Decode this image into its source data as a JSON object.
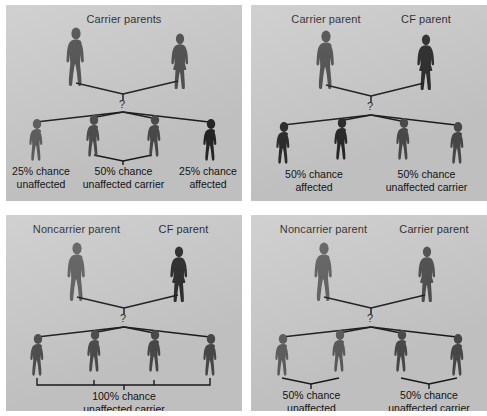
{
  "figure": {
    "caption_title": "Cystic fibrosis inheritance patterns",
    "colors": {
      "panel_background": "#c9c9c9",
      "page_background": "#ffffff",
      "figure_unaffected": "#5a5a5a",
      "figure_carrier": "#4a4a4a",
      "figure_affected": "#262626",
      "line": "#1a1a1a",
      "text": "#131313"
    },
    "unknown_marker": "?"
  },
  "panels": [
    {
      "id": "panel-carrier-x-carrier",
      "position": "top-left",
      "parents": [
        {
          "label": "Carrier parents",
          "sex": "male",
          "status": "carrier"
        },
        {
          "label": "",
          "sex": "female",
          "status": "carrier"
        }
      ],
      "parent_title": "Carrier parents",
      "parent_title_span": "both",
      "children": [
        {
          "status": "unaffected"
        },
        {
          "status": "carrier"
        },
        {
          "status": "carrier"
        },
        {
          "status": "affected"
        }
      ],
      "brackets": [
        {
          "type": "vee",
          "children": [
            1,
            2
          ]
        }
      ],
      "outcomes": [
        {
          "percent": "25% chance",
          "phenotype": "unaffected",
          "children": [
            0
          ]
        },
        {
          "percent": "50% chance",
          "phenotype": "unaffected carrier",
          "children": [
            1,
            2
          ]
        },
        {
          "percent": "25% chance",
          "phenotype": "affected",
          "children": [
            3
          ]
        }
      ]
    },
    {
      "id": "panel-carrier-x-cf",
      "position": "top-right",
      "parents": [
        {
          "label": "Carrier parent",
          "sex": "male",
          "status": "carrier"
        },
        {
          "label": "CF parent",
          "sex": "female",
          "status": "affected"
        }
      ],
      "children": [
        {
          "status": "affected"
        },
        {
          "status": "affected"
        },
        {
          "status": "carrier"
        },
        {
          "status": "carrier"
        }
      ],
      "brackets": [],
      "outcomes": [
        {
          "percent": "50% chance",
          "phenotype": "affected",
          "children": [
            0,
            1
          ]
        },
        {
          "percent": "50% chance",
          "phenotype": "unaffected carrier",
          "children": [
            2,
            3
          ]
        }
      ]
    },
    {
      "id": "panel-noncarrier-x-cf",
      "position": "bottom-left",
      "parents": [
        {
          "label": "Noncarrier parent",
          "sex": "male",
          "status": "unaffected"
        },
        {
          "label": "CF parent",
          "sex": "female",
          "status": "affected"
        }
      ],
      "children": [
        {
          "status": "carrier"
        },
        {
          "status": "carrier"
        },
        {
          "status": "carrier"
        },
        {
          "status": "carrier"
        }
      ],
      "brackets": [
        {
          "type": "square",
          "children": [
            0,
            1,
            2,
            3
          ]
        }
      ],
      "outcomes": [
        {
          "percent": "100% chance",
          "phenotype": "unaffected carrier",
          "children": [
            0,
            1,
            2,
            3
          ]
        }
      ]
    },
    {
      "id": "panel-noncarrier-x-carrier",
      "position": "bottom-right",
      "parents": [
        {
          "label": "Noncarrier parent",
          "sex": "male",
          "status": "unaffected"
        },
        {
          "label": "Carrier parent",
          "sex": "female",
          "status": "carrier"
        }
      ],
      "children": [
        {
          "status": "unaffected"
        },
        {
          "status": "unaffected"
        },
        {
          "status": "carrier"
        },
        {
          "status": "carrier"
        }
      ],
      "brackets": [
        {
          "type": "vee",
          "children": [
            0,
            1
          ]
        },
        {
          "type": "vee",
          "children": [
            2,
            3
          ]
        }
      ],
      "outcomes": [
        {
          "percent": "50% chance",
          "phenotype": "unaffected",
          "children": [
            0,
            1
          ]
        },
        {
          "percent": "50% chance",
          "phenotype": "unaffected carrier",
          "children": [
            2,
            3
          ]
        }
      ]
    }
  ]
}
